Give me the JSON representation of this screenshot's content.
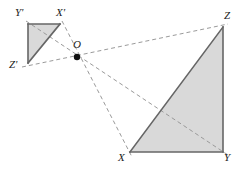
{
  "figure": {
    "type": "geometry-diagram",
    "width": 236,
    "height": 170,
    "background_color": "#ffffff",
    "style": {
      "fill_color": "#d9d9d9",
      "solid_stroke_color": "#666666",
      "solid_stroke_width": 1.6,
      "dashed_stroke_color": "#9a9a9a",
      "dashed_stroke_width": 1,
      "dash_pattern": "4 3",
      "point_color": "#111111",
      "label_color": "#1a1a1a"
    },
    "points": [
      {
        "id": "Yp",
        "label": "Y'",
        "x": 28,
        "y": 24,
        "label_x": 15,
        "label_y": 7,
        "marked": false
      },
      {
        "id": "Xp",
        "label": "X'",
        "x": 60,
        "y": 24,
        "label_x": 56,
        "label_y": 7,
        "marked": false
      },
      {
        "id": "Zp",
        "label": "Z'",
        "x": 28,
        "y": 63,
        "label_x": 9,
        "label_y": 59,
        "marked": false
      },
      {
        "id": "O",
        "label": "O",
        "x": 77,
        "y": 57,
        "label_x": 73,
        "label_y": 39,
        "marked": true
      },
      {
        "id": "Z",
        "label": "Z",
        "x": 223,
        "y": 27,
        "label_x": 224,
        "label_y": 10,
        "marked": false
      },
      {
        "id": "X",
        "label": "X",
        "x": 130,
        "y": 152,
        "label_x": 118,
        "label_y": 152,
        "marked": false
      },
      {
        "id": "Y",
        "label": "Y",
        "x": 223,
        "y": 152,
        "label_x": 224,
        "label_y": 152,
        "marked": false
      }
    ],
    "filled_polygons": [
      {
        "id": "small-triangle",
        "name": "triangle-X-prime-Y-prime-Z-prime",
        "vertices": "28,24 60,24 28,63"
      },
      {
        "id": "large-triangle",
        "name": "triangle-X-Y-Z",
        "vertices": "223,27 223,152 130,152"
      }
    ],
    "solid_edges": [
      {
        "id": "yp-xp",
        "name": "edge-Y-prime-X-prime",
        "x1": 28,
        "y1": 24,
        "x2": 60,
        "y2": 24
      },
      {
        "id": "yp-zp",
        "name": "edge-Y-prime-Z-prime",
        "x1": 28,
        "y1": 24,
        "x2": 28,
        "y2": 63
      },
      {
        "id": "zp-xp",
        "name": "edge-Z-prime-X-prime",
        "x1": 28,
        "y1": 63,
        "x2": 60,
        "y2": 24
      },
      {
        "id": "z-y",
        "name": "edge-Z-Y",
        "x1": 223,
        "y1": 27,
        "x2": 223,
        "y2": 152
      },
      {
        "id": "x-y",
        "name": "edge-X-Y",
        "x1": 130,
        "y1": 152,
        "x2": 223,
        "y2": 152
      },
      {
        "id": "x-z",
        "name": "edge-X-Z",
        "x1": 130,
        "y1": 152,
        "x2": 223,
        "y2": 27
      }
    ],
    "dashed_rays": [
      {
        "id": "zp-o-z",
        "name": "ray-Z-prime-through-O-to-Z",
        "x1": 22,
        "y1": 67,
        "x2": 228,
        "y2": 24
      },
      {
        "id": "xp-o-x",
        "name": "ray-X-prime-through-O-to-X",
        "x1": 62,
        "y1": 21,
        "x2": 132,
        "y2": 157
      },
      {
        "id": "yp-o-y",
        "name": "ray-Y-prime-through-O-to-Y",
        "x1": 26,
        "y1": 21,
        "x2": 228,
        "y2": 155
      }
    ],
    "point_radius": 3.2
  }
}
